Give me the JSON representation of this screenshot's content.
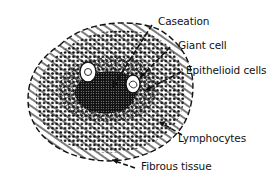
{
  "figure": {
    "colors": {
      "ink": "#111111",
      "background": "#ffffff"
    }
  },
  "labels": [
    {
      "id": "caseation",
      "text": "Caseation"
    },
    {
      "id": "giant-cell",
      "text": "Giant cell"
    },
    {
      "id": "epithelioid-cells",
      "text": "Epithelioid cells"
    },
    {
      "id": "lymphocytes",
      "text": "Lymphocytes"
    },
    {
      "id": "fibrous-tissue",
      "text": "Fibrous tissue"
    }
  ]
}
